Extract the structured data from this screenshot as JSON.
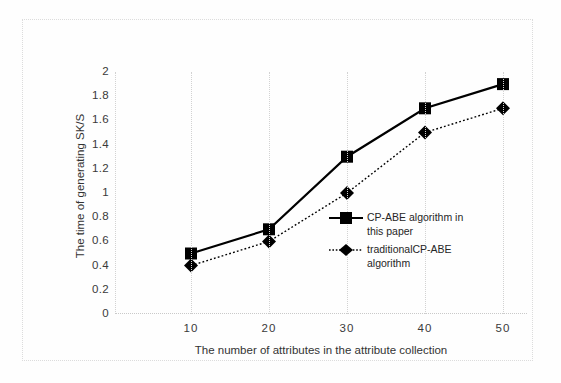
{
  "chart_data": {
    "type": "line",
    "title": "",
    "subtitle": "",
    "xlabel": "The number of attributes in the attribute collection",
    "ylabel": "The time of generating  SK/S",
    "x": [
      10,
      20,
      30,
      40,
      50
    ],
    "categories": [
      "10",
      "20",
      "30",
      "40",
      "50"
    ],
    "xtick_labels": [
      "10",
      "20",
      "30",
      "40",
      "50"
    ],
    "ytick_labels": [
      "2",
      "1.8",
      "1.6",
      "1.4",
      "1.2",
      "1",
      "0.8",
      "0.6",
      "0.4",
      "0.2",
      "0"
    ],
    "ylim": [
      0,
      2
    ],
    "xlim": [
      0,
      60
    ],
    "ytick_step": 0.2,
    "grid": "vertical-dotted",
    "legend_position": "inside-right-middle",
    "series": [
      {
        "name": "CP-ABE algorithm in this paper",
        "marker": "square",
        "line_style": "solid",
        "color": "#000000",
        "values": [
          0.5,
          0.7,
          1.3,
          1.7,
          1.9
        ]
      },
      {
        "name": "traditionalCP-ABE algorithm",
        "marker": "diamond",
        "line_style": "dotted",
        "color": "#000000",
        "values": [
          0.4,
          0.6,
          1.0,
          1.5,
          1.7
        ]
      }
    ]
  },
  "legend": {
    "entries": [
      {
        "label_line1": "CP-ABE algorithm in",
        "label_line2": "this paper",
        "full": "CP-ABE algorithm in this paper"
      },
      {
        "label_line1": "traditionalCP-ABE",
        "label_line2": "algorithm",
        "full": "traditionalCP-ABE algorithm"
      }
    ]
  },
  "axes": {
    "y_title": "The time of generating  SK/S",
    "x_title": "The number of attributes in the attribute collection",
    "y_ticks": [
      "2",
      "1.8",
      "1.6",
      "1.4",
      "1.2",
      "1",
      "0.8",
      "0.6",
      "0.4",
      "0.2",
      "0"
    ],
    "x_ticks": [
      "10",
      "20",
      "30",
      "40",
      "50"
    ]
  },
  "colors": {
    "series_ink": "#000000",
    "grid": "#d2d2d2",
    "frame": "#dcdcdc",
    "text": "#333333",
    "background": "#fefefe"
  }
}
